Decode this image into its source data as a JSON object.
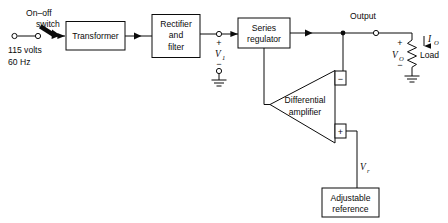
{
  "diagram": {
    "colors": {
      "ink": "#0b0b0b",
      "paper": "#ffffff"
    },
    "source": {
      "switch_label_line1": "On–off",
      "switch_label_line2": "switch",
      "mains_line1": "115 volts",
      "mains_line2": "60 Hz"
    },
    "blocks": {
      "transformer": {
        "label": "Transformer"
      },
      "rectifier": {
        "line1": "Rectifier",
        "line2": "and",
        "line3": "filter"
      },
      "series_regulator": {
        "line1": "Series",
        "line2": "regulator"
      },
      "differential_amplifier": {
        "line1": "Differential",
        "line2": "amplifier"
      },
      "adjustable_reference": {
        "line1": "Adjustable",
        "line2": "reference"
      }
    },
    "nodes": {
      "v1_symbol": "V",
      "v1_subscript": "1",
      "v1_plus": "+",
      "v1_minus": "−",
      "output_label": "Output",
      "vo_symbol": "V",
      "vo_subscript": "O",
      "vo_plus": "+",
      "vo_minus": "−",
      "io_symbol": "I",
      "io_subscript": "O",
      "load_label": "Load",
      "vr_symbol": "V",
      "vr_subscript": "r",
      "amp_inverting": "−",
      "amp_noninverting": "+"
    },
    "icons": {
      "ground": "ground-symbol",
      "resistor": "resistor-zigzag",
      "terminal": "open-terminal-circle",
      "junction": "junction-dot",
      "flow_arrow": "signal-flow-arrow",
      "callout_arrow": "callout-pointer-arrow"
    }
  }
}
